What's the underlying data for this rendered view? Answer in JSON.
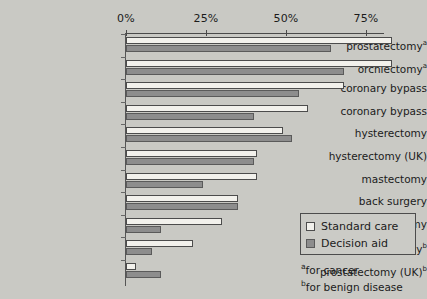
{
  "chart_data": {
    "type": "bar",
    "orientation": "horizontal",
    "title": "",
    "xlabel": "",
    "ylabel": "",
    "xlim": [
      0,
      93
    ],
    "xticks": [
      0,
      25,
      50,
      75
    ],
    "xtick_labels": [
      "0%",
      "25%",
      "50%",
      "75%"
    ],
    "grid": false,
    "legend_position": "lower-right-inside",
    "categories": [
      "prostatectomyᵃ",
      "orchiectomyᵃ",
      "coronary bypass",
      "coronary bypass",
      "hysterectomy",
      "hysterectomy (UK)",
      "mastectomy",
      "back surgery",
      "mastectomy",
      "prostatectomyᵇ",
      "prostatectomy (UK)ᵇ"
    ],
    "series": [
      {
        "name": "Standard care",
        "color": "#f2f1ec",
        "values": [
          83,
          83,
          68,
          57,
          49,
          41,
          41,
          35,
          30,
          21,
          3
        ]
      },
      {
        "name": "Decision aid",
        "color": "#8d8d8d",
        "values": [
          64,
          68,
          54,
          40,
          52,
          40,
          24,
          35,
          11,
          8,
          11
        ]
      }
    ]
  },
  "axis": {
    "ticks": [
      {
        "label": "0%",
        "value": 0
      },
      {
        "label": "25%",
        "value": 25
      },
      {
        "label": "50%",
        "value": 50
      },
      {
        "label": "75%",
        "value": 75
      }
    ]
  },
  "categories": [
    {
      "name": "prostatectomy",
      "sup": "a"
    },
    {
      "name": "orchiectomy",
      "sup": "a"
    },
    {
      "name": "coronary bypass",
      "sup": ""
    },
    {
      "name": "coronary bypass",
      "sup": ""
    },
    {
      "name": "hysterectomy",
      "sup": ""
    },
    {
      "name": "hysterectomy (UK)",
      "sup": ""
    },
    {
      "name": "mastectomy",
      "sup": ""
    },
    {
      "name": "back surgery",
      "sup": ""
    },
    {
      "name": "mastectomy",
      "sup": ""
    },
    {
      "name": "prostatectomy",
      "sup": "b"
    },
    {
      "name": "prostatectomy (UK)",
      "sup": "b"
    }
  ],
  "legend": {
    "items": [
      {
        "label": "Standard care",
        "swatch": "standard"
      },
      {
        "label": "Decision aid",
        "swatch": "aid"
      }
    ]
  },
  "footnotes": [
    {
      "marker": "a",
      "text": "for cancer"
    },
    {
      "marker": "b",
      "text": "for benign disease"
    }
  ],
  "colors": {
    "background": "#c9c9c4",
    "standard_care": "#f2f1ec",
    "decision_aid": "#8d8d8d",
    "axis": "#4a4a4a",
    "text": "#1b1b1b"
  }
}
